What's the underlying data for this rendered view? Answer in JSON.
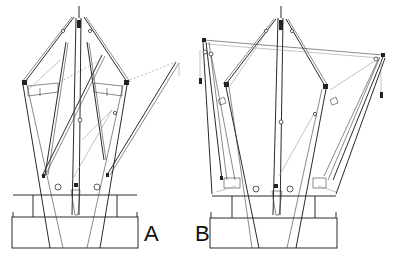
{
  "figure": {
    "panels": [
      {
        "id": "A",
        "label": "A"
      },
      {
        "id": "B",
        "label": "B"
      }
    ]
  },
  "colors": {
    "line": "#2a2a2a",
    "light_line": "#9a9a9a",
    "background": "#ffffff"
  }
}
